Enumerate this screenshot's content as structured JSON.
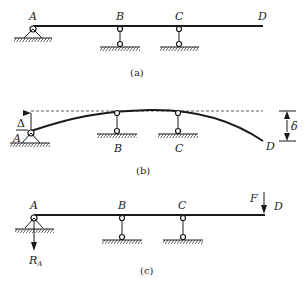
{
  "figure_a": {
    "caption": "(a)",
    "labels": {
      "A": "A",
      "B": "B",
      "C": "C",
      "D": "D"
    }
  },
  "figure_b": {
    "caption": "(b)",
    "labels": {
      "A": "A",
      "B": "B",
      "C": "C",
      "D": "D",
      "delta_small": "Δ",
      "delta": "δ"
    }
  },
  "figure_c": {
    "caption": "(c)",
    "labels": {
      "A": "A",
      "B": "B",
      "C": "C",
      "D": "D",
      "F": "F",
      "RA": "R",
      "RA_sub": "A"
    }
  },
  "colors": {
    "line": "#1a1a1a",
    "background": "#ffffff"
  }
}
